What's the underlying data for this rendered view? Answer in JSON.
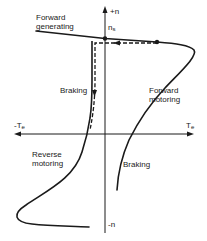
{
  "diagram": {
    "axes": {
      "vertical_positive": "+n",
      "vertical_negative": "-n",
      "horizontal_positive_main": "T",
      "horizontal_positive_sub": "e",
      "horizontal_negative_main": "-T",
      "horizontal_negative_sub": "e",
      "sync_speed_main": "n",
      "sync_speed_sub": "s"
    },
    "regions": {
      "forward_generating_line1": "Forward",
      "forward_generating_line2": "generating",
      "braking_upper": "Braking",
      "forward_motoring_line1": "Forward",
      "forward_motoring_line2": "motoring",
      "reverse_motoring_line1": "Reverse",
      "reverse_motoring_line2": "motoring",
      "braking_lower": "Braking"
    },
    "colors": {
      "ink": "#1a1a1a",
      "background": "#ffffff"
    }
  }
}
